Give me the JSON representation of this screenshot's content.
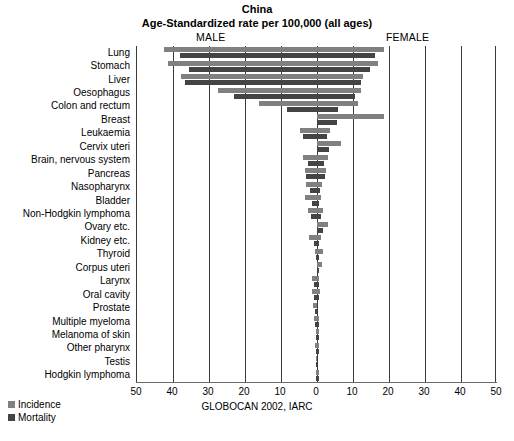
{
  "header": {
    "title_line1": "China",
    "title_line2": "Age-Standardized rate per 100,000 (all ages)",
    "male_label": "MALE",
    "female_label": "FEMALE"
  },
  "source_note": "GLOBOCAN 2002, IARC",
  "legend": {
    "incidence_label": "Incidence",
    "mortality_label": "Mortality",
    "incidence_color": "#808080",
    "mortality_color": "#444444"
  },
  "axis": {
    "tick_labels": [
      "50",
      "40",
      "30",
      "20",
      "10",
      "0",
      "10",
      "20",
      "30",
      "40",
      "50"
    ],
    "tick_values": [
      -50,
      -40,
      -30,
      -20,
      -10,
      0,
      10,
      20,
      30,
      40,
      50
    ]
  },
  "chart_data": {
    "type": "bar",
    "orientation": "horizontal-pyramid",
    "xlabel": "Age-Standardized rate per 100,000",
    "ylabel": "",
    "xlim": [
      -50,
      50
    ],
    "grid": true,
    "legend_position": "bottom-left",
    "annotations": [
      "MALE",
      "FEMALE",
      "GLOBOCAN 2002, IARC"
    ],
    "categories": [
      "Lung",
      "Stomach",
      "Liver",
      "Oesophagus",
      "Colon and rectum",
      "Breast",
      "Leukaemia",
      "Cervix uteri",
      "Brain, nervous system",
      "Pancreas",
      "Nasopharynx",
      "Bladder",
      "Non-Hodgkin lymphoma",
      "Ovary etc.",
      "Kidney etc.",
      "Thyroid",
      "Corpus uteri",
      "Larynx",
      "Oral cavity",
      "Prostate",
      "Multiple myeloma",
      "Melanoma of skin",
      "Other pharynx",
      "Testis",
      "Hodgkin lymphoma"
    ],
    "series": [
      {
        "name": "Incidence",
        "side": "male",
        "color": "#808080",
        "values": [
          42.4,
          41.4,
          37.9,
          27.5,
          16.2,
          0.0,
          4.6,
          0.0,
          4.0,
          3.3,
          3.1,
          3.3,
          2.6,
          0.0,
          2.1,
          0.6,
          0.0,
          1.5,
          1.4,
          1.2,
          0.7,
          0.4,
          0.5,
          0.3,
          0.4
        ]
      },
      {
        "name": "Mortality",
        "side": "male",
        "color": "#444444",
        "values": [
          38.0,
          35.5,
          36.6,
          23.0,
          8.4,
          0.0,
          3.9,
          0.0,
          2.6,
          3.1,
          2.0,
          1.5,
          1.7,
          0.0,
          0.9,
          0.2,
          0.0,
          0.8,
          0.7,
          0.5,
          0.5,
          0.2,
          0.4,
          0.1,
          0.2
        ]
      },
      {
        "name": "Incidence",
        "side": "female",
        "color": "#808080",
        "values": [
          18.5,
          17.0,
          12.8,
          12.2,
          11.4,
          18.7,
          3.5,
          6.8,
          3.0,
          2.5,
          1.4,
          1.0,
          1.7,
          3.1,
          1.0,
          1.7,
          1.3,
          0.2,
          0.7,
          0.0,
          0.5,
          0.3,
          0.1,
          0.0,
          0.2
        ]
      },
      {
        "name": "Mortality",
        "side": "female",
        "color": "#444444",
        "values": [
          16.0,
          14.8,
          12.3,
          10.6,
          5.9,
          5.5,
          2.9,
          3.2,
          2.0,
          2.3,
          0.9,
          0.5,
          1.1,
          1.6,
          0.5,
          0.3,
          0.4,
          0.1,
          0.4,
          0.0,
          0.3,
          0.2,
          0.1,
          0.0,
          0.1
        ]
      }
    ]
  }
}
